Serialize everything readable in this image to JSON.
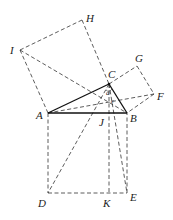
{
  "diagram": {
    "points": {
      "A": {
        "x": 48,
        "y": 113
      },
      "B": {
        "x": 127,
        "y": 113
      },
      "C": {
        "x": 109,
        "y": 84
      },
      "D": {
        "x": 48,
        "y": 193
      },
      "E": {
        "x": 127,
        "y": 193
      },
      "F": {
        "x": 154,
        "y": 94
      },
      "G": {
        "x": 137,
        "y": 66
      },
      "H": {
        "x": 82,
        "y": 20
      },
      "I": {
        "x": 20,
        "y": 50
      },
      "J": {
        "x": 109,
        "y": 113
      },
      "K": {
        "x": 109,
        "y": 193
      }
    },
    "labels": {
      "A": "A",
      "B": "B",
      "C": "C",
      "D": "D",
      "E": "E",
      "F": "F",
      "G": "G",
      "H": "H",
      "I": "I",
      "J": "J",
      "K": "K"
    },
    "angle_marks": [
      "a",
      "c"
    ],
    "solid_segments": [
      "AB",
      "BC",
      "CA"
    ],
    "dashed_segments": [
      "AI",
      "IH",
      "HC",
      "CG",
      "GF",
      "FB",
      "AD",
      "DE",
      "EB",
      "CK",
      "IB",
      "CD",
      "AF",
      "CE"
    ]
  }
}
